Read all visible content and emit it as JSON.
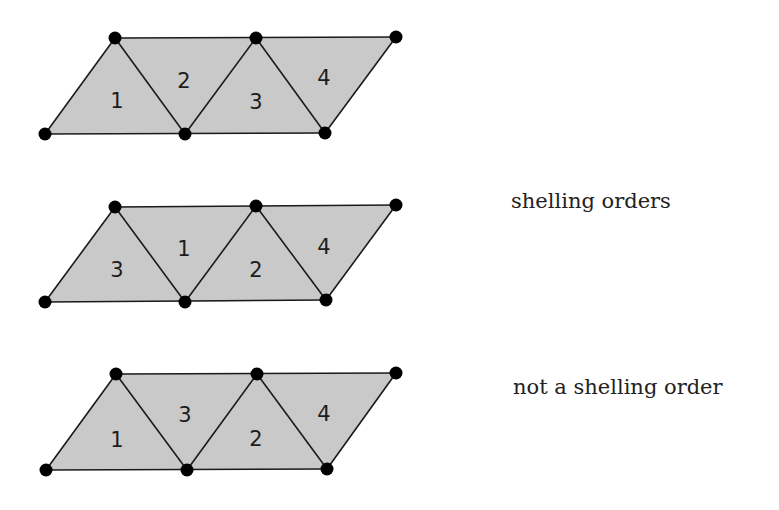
{
  "figure": {
    "rows": [
      {
        "id": "row-1",
        "group": "shelling",
        "vertices": {
          "top": [
            [
              115,
              38
            ],
            [
              256,
              38
            ],
            [
              396,
              37
            ]
          ],
          "bottom": [
            [
              45,
              134
            ],
            [
              185,
              134
            ],
            [
              325,
              133
            ]
          ]
        },
        "triangle_labels": [
          "1",
          "2",
          "3",
          "4"
        ],
        "label_positions": [
          [
            117,
            101
          ],
          [
            184,
            81
          ],
          [
            256,
            102
          ],
          [
            324,
            78
          ]
        ]
      },
      {
        "id": "row-2",
        "group": "shelling",
        "vertices": {
          "top": [
            [
              115,
              207
            ],
            [
              256,
              206
            ],
            [
              396,
              205
            ]
          ],
          "bottom": [
            [
              45,
              302
            ],
            [
              185,
              302
            ],
            [
              326,
              300
            ]
          ]
        },
        "triangle_labels": [
          "3",
          "1",
          "2",
          "4"
        ],
        "label_positions": [
          [
            117,
            270
          ],
          [
            184,
            249
          ],
          [
            256,
            270
          ],
          [
            324,
            247
          ]
        ]
      },
      {
        "id": "row-3",
        "group": "not-shelling",
        "vertices": {
          "top": [
            [
              116,
              374
            ],
            [
              257,
              374
            ],
            [
              396,
              373
            ]
          ],
          "bottom": [
            [
              46,
              470
            ],
            [
              187,
              470
            ],
            [
              327,
              469
            ]
          ]
        },
        "triangle_labels": [
          "1",
          "3",
          "2",
          "4"
        ],
        "label_positions": [
          [
            117,
            440
          ],
          [
            185,
            415
          ],
          [
            256,
            439
          ],
          [
            324,
            414
          ]
        ]
      }
    ],
    "captions": {
      "shelling": "shelling orders",
      "not_shelling": "not a shelling order"
    },
    "colors": {
      "fill": "#c9c9c9",
      "edge": "#1a1a1a",
      "vertex": "#000000",
      "text": "#222222"
    }
  }
}
